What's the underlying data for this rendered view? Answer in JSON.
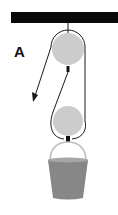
{
  "diagram": {
    "label": "A",
    "colors": {
      "beam": "#0a0a0a",
      "rope": "#1a1a1a",
      "pulley": "#cccccc",
      "bucket": "#878787",
      "bucket_rim": "#a6a6a6",
      "handle": "#bdbdbd",
      "connector": "#111111"
    },
    "components": [
      {
        "id": "ceiling-beam",
        "description": "Fixed overhead beam"
      },
      {
        "id": "fixed-pulley",
        "description": "Upper pulley attached to beam"
      },
      {
        "id": "movable-pulley",
        "description": "Lower pulley supporting bucket"
      },
      {
        "id": "rope",
        "description": "Rope wrapped around both pulleys, pulled downward"
      },
      {
        "id": "pull-arrow",
        "description": "Arrow showing pull direction (down-left)"
      },
      {
        "id": "bucket",
        "description": "Bucket load hanging from lower pulley"
      }
    ]
  }
}
